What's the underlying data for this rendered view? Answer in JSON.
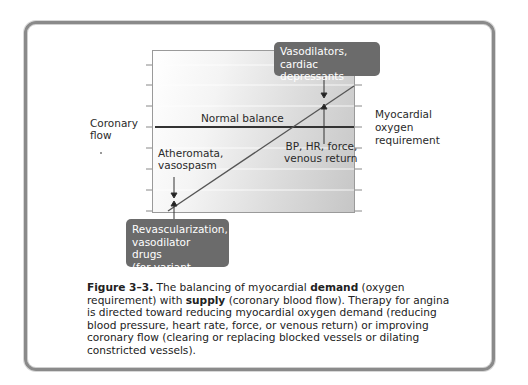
{
  "figure": {
    "left_axis_label": "Coronary\nflow",
    "right_axis_label": "Myocardial\noxygen\nrequirement",
    "normal_balance_label": "Normal balance",
    "annotations": {
      "atheromata": "Atheromata,\nvasospasm",
      "bp_hr": "BP, HR, force,\nvenous return"
    },
    "callouts": {
      "top": "Vasodilators,\ncardiac depressants",
      "bottom": "Revascularization,\nvasodilator drugs\n(for variant angina)"
    },
    "colors": {
      "callout_bg": "#6b6b6b",
      "frame_border": "#8a8a8a",
      "normal_line": "#333333",
      "diagonal_line": "#555555"
    }
  },
  "caption": {
    "figure_number": "Figure 3–3.",
    "part1": " The balancing of myocardial ",
    "demand": "demand",
    "part2": " (oxygen requirement) with ",
    "supply": "supply",
    "part3": " (coronary blood flow). Therapy for angina is directed toward reducing myocardial oxygen demand (reducing blood pressure, heart rate, force, or venous return) or improving coronary flow (clearing or replacing blocked vessels or dilating constricted vessels)."
  }
}
